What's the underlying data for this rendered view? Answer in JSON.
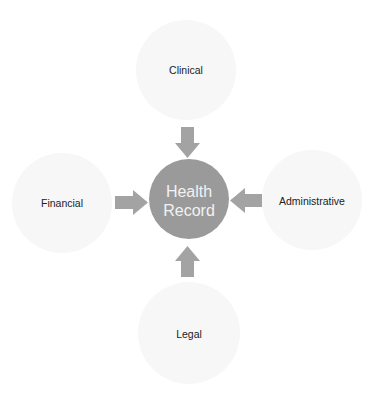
{
  "diagram": {
    "type": "hub-and-spoke",
    "center": {
      "label_lines": [
        "Health",
        "Record"
      ],
      "color": "#9a9a9a",
      "text_color": "#f2f2f2"
    },
    "nodes": [
      {
        "id": "top",
        "label": "Clinical"
      },
      {
        "id": "left",
        "label": "Financial"
      },
      {
        "id": "right",
        "label": "Administrative"
      },
      {
        "id": "bottom",
        "label": "Legal"
      }
    ],
    "node_color": "#f7f7f7",
    "arrow_color": "#a3a3a3",
    "edges": [
      {
        "from": "Clinical",
        "to": "Health Record",
        "direction": "down"
      },
      {
        "from": "Financial",
        "to": "Health Record",
        "direction": "right"
      },
      {
        "from": "Administrative",
        "to": "Health Record",
        "direction": "left"
      },
      {
        "from": "Legal",
        "to": "Health Record",
        "direction": "up"
      }
    ]
  }
}
